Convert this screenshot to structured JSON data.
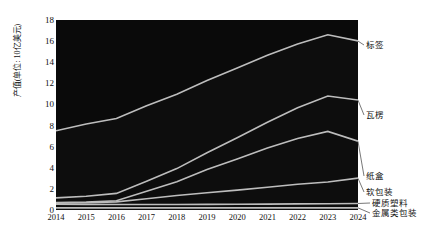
{
  "chart_data": {
    "type": "area",
    "title": "",
    "xlabel": "",
    "ylabel": "产值(单位: 10亿美元)",
    "categories": [
      2014,
      2015,
      2016,
      2017,
      2018,
      2019,
      2020,
      2021,
      2022,
      2023,
      2024
    ],
    "xlim": [
      2014,
      2024
    ],
    "ylim": [
      0,
      18
    ],
    "yticks": [
      0,
      2,
      4,
      6,
      8,
      10,
      12,
      14,
      16,
      18
    ],
    "grid": false,
    "stacked": true,
    "legend_position": "right-inline",
    "series": [
      {
        "name": "金属类包装",
        "values": [
          0.2,
          0.2,
          0.2,
          0.2,
          0.2,
          0.2,
          0.2,
          0.2,
          0.2,
          0.2,
          0.2
        ]
      },
      {
        "name": "硬质塑料",
        "values": [
          0.35,
          0.33,
          0.32,
          0.32,
          0.32,
          0.33,
          0.34,
          0.36,
          0.38,
          0.4,
          0.42
        ]
      },
      {
        "name": "软包装",
        "values": [
          0.1,
          0.15,
          0.25,
          0.55,
          0.85,
          1.1,
          1.35,
          1.6,
          1.85,
          2.05,
          2.4
        ]
      },
      {
        "name": "纸盒",
        "values": [
          0.05,
          0.07,
          0.1,
          0.7,
          1.3,
          2.2,
          2.95,
          3.7,
          4.35,
          4.8,
          3.5
        ]
      },
      {
        "name": "瓦楞",
        "values": [
          0.45,
          0.55,
          0.7,
          0.95,
          1.25,
          1.6,
          2.0,
          2.45,
          2.9,
          3.35,
          3.9
        ]
      },
      {
        "name": "标签",
        "values": [
          6.35,
          6.85,
          7.1,
          7.15,
          7.05,
          6.85,
          6.6,
          6.35,
          6.05,
          5.8,
          5.6
        ]
      }
    ],
    "stack_tops": {
      "金属类包装": [
        0.2,
        0.2,
        0.2,
        0.2,
        0.2,
        0.2,
        0.2,
        0.2,
        0.2,
        0.2,
        0.2
      ],
      "硬质塑料": [
        0.55,
        0.53,
        0.52,
        0.52,
        0.52,
        0.53,
        0.54,
        0.56,
        0.58,
        0.6,
        0.62
      ],
      "软包装": [
        0.65,
        0.68,
        0.77,
        1.07,
        1.37,
        1.63,
        1.89,
        2.16,
        2.43,
        2.65,
        3.02
      ],
      "纸盒": [
        0.7,
        0.75,
        0.87,
        1.77,
        2.67,
        3.83,
        4.84,
        5.86,
        6.78,
        7.45,
        6.52
      ],
      "瓦楞": [
        1.15,
        1.3,
        1.57,
        2.72,
        3.92,
        5.43,
        6.84,
        8.31,
        9.68,
        10.8,
        10.42
      ],
      "标签": [
        7.5,
        8.15,
        8.67,
        9.87,
        10.97,
        12.28,
        13.44,
        14.66,
        15.73,
        16.6,
        16.02
      ]
    },
    "series_labels": [
      {
        "name": "标签",
        "y_value": 16.0
      },
      {
        "name": "瓦楞",
        "y_value": 10.4
      },
      {
        "name": "纸盒",
        "y_value": 6.5
      },
      {
        "name": "软包装",
        "y_value": 3.0
      },
      {
        "name": "硬质塑料",
        "y_value": 0.62
      },
      {
        "name": "金属类包装",
        "y_value": 0.2
      }
    ],
    "colors": {
      "area_fill": "#0d0d0d",
      "line": "#bdbdbd",
      "background": "#ffffff",
      "text": "#111111"
    }
  }
}
